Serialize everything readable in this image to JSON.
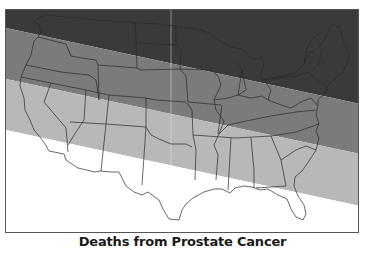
{
  "map": {
    "title": "Deaths from Prostate Cancer",
    "region": "Contiguous United States",
    "bands": [
      {
        "name": "darkest",
        "color": "#3a3a3a",
        "order": 1
      },
      {
        "name": "dark",
        "color": "#7b7b7b",
        "order": 2
      },
      {
        "name": "light",
        "color": "#b8b8b8",
        "order": 3
      },
      {
        "name": "lightest",
        "color": "#ffffff",
        "order": 4
      }
    ],
    "outline_color": "#2a2a2a",
    "frame_color": "#555555"
  }
}
